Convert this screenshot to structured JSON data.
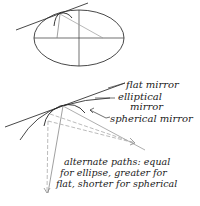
{
  "diagram": {
    "type": "optics-mirror-comparison",
    "labels": {
      "flat_mirror": "flat mirror",
      "elliptical_line1": "elliptical",
      "elliptical_line2": "mirror",
      "spherical_mirror": "spherical mirror",
      "caption_line1": "alternate paths: equal",
      "caption_line2": "for ellipse, greater for",
      "caption_line3": "flat, shorter for spherical"
    },
    "colors": {
      "ink": "#222222",
      "light_line": "#999999",
      "dashed": "#aaaaaa"
    }
  }
}
